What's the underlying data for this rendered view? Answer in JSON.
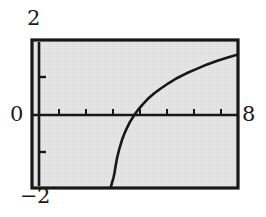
{
  "figure": {
    "kind": "graphing-calculator-plot",
    "background_color": "#ffffff",
    "plot_background_color": "#e2e2e2",
    "ink_color": "#171717"
  },
  "labels": {
    "y_max": "2",
    "y_min": "−2",
    "x_min": "0",
    "x_max": "8"
  },
  "chart_data": {
    "type": "line",
    "title": "",
    "xlabel": "",
    "ylabel": "",
    "xlim": [
      0,
      8
    ],
    "ylim": [
      -2,
      2
    ],
    "grid": false,
    "legend": null,
    "x_tick_labels": [
      "0",
      "8"
    ],
    "y_tick_labels": [
      "2",
      "0",
      "-2"
    ],
    "x_ticks": [
      1,
      2,
      3,
      4,
      5,
      6,
      7
    ],
    "y_ticks": [
      -1,
      1
    ],
    "axes": {
      "x_axis_drawn_at_y": 0,
      "y_axis_drawn_at_x": 0,
      "frame": true
    },
    "annotations": [
      "vertical asymptote near x = 3",
      "x-intercept at x = 4",
      "curve clipped at bottom of frame (y = -2)"
    ],
    "series": [
      {
        "name": "y = ln(x - 3)",
        "x": [
          3.05,
          3.08,
          3.12,
          3.16,
          3.2,
          3.25,
          3.3,
          3.4,
          3.5,
          3.6,
          3.7,
          3.8,
          3.9,
          4.0,
          4.15,
          4.3,
          4.5,
          4.75,
          5.0,
          5.3,
          5.6,
          6.0,
          6.4,
          6.8,
          7.2,
          7.6,
          8.0
        ],
        "y": [
          -2.0,
          -1.93,
          -1.83,
          -1.73,
          -1.61,
          -1.39,
          -1.2,
          -0.92,
          -0.69,
          -0.51,
          -0.36,
          -0.22,
          -0.11,
          0.0,
          0.14,
          0.26,
          0.41,
          0.56,
          0.69,
          0.83,
          0.96,
          1.1,
          1.22,
          1.34,
          1.44,
          1.53,
          1.61
        ]
      }
    ]
  }
}
